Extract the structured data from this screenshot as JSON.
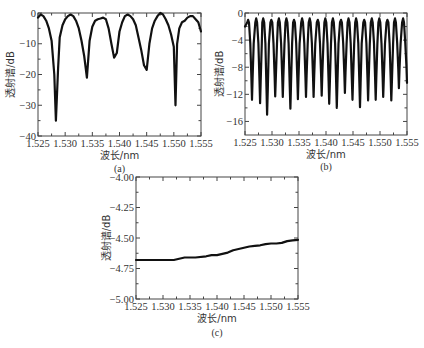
{
  "chart_data": [
    {
      "id": "a",
      "type": "line",
      "panel_label": "(a)",
      "xlabel": "波长/nm",
      "ylabel": "透射谱/dB",
      "xlim": [
        1.525,
        1.555
      ],
      "ylim": [
        -40,
        0
      ],
      "xticks": [
        "1.525",
        "1.530",
        "1.535",
        "1.540",
        "1.545",
        "1.550",
        "1.555"
      ],
      "yticks": [
        "0",
        "−10",
        "−20",
        "−30",
        "−40"
      ],
      "ytick_values": [
        0,
        -10,
        -20,
        -30,
        -40
      ],
      "grid": false,
      "x": [
        1.525,
        1.5255,
        1.526,
        1.5265,
        1.527,
        1.5275,
        1.528,
        1.5283,
        1.5287,
        1.529,
        1.5295,
        1.53,
        1.5305,
        1.531,
        1.5315,
        1.532,
        1.5325,
        1.533,
        1.5335,
        1.534,
        1.5345,
        1.535,
        1.5355,
        1.536,
        1.5365,
        1.537,
        1.5375,
        1.538,
        1.5385,
        1.539,
        1.5395,
        1.54,
        1.5405,
        1.541,
        1.5415,
        1.542,
        1.5425,
        1.543,
        1.5435,
        1.544,
        1.5445,
        1.545,
        1.5455,
        1.546,
        1.5465,
        1.547,
        1.5475,
        1.548,
        1.5485,
        1.549,
        1.5495,
        1.55,
        1.5503,
        1.5506,
        1.551,
        1.5515,
        1.552,
        1.5525,
        1.553,
        1.5535,
        1.554,
        1.5545,
        1.555
      ],
      "values": [
        -1.5,
        -0.5,
        -1,
        -2.5,
        -5,
        -9,
        -20,
        -35,
        -18,
        -8,
        -4,
        -2,
        -1,
        -0.5,
        -1,
        -2.5,
        -5,
        -9,
        -14,
        -21,
        -9,
        -4.5,
        -2.5,
        -2,
        -1.8,
        -1.5,
        -2,
        -5,
        -10,
        -14.5,
        -13,
        -6,
        -3,
        -1,
        -0.5,
        -1,
        -2,
        -4,
        -8,
        -12,
        -17,
        -18.5,
        -10,
        -5,
        -2.5,
        -1,
        0,
        -0.5,
        -2,
        -4,
        -7,
        -11,
        -30,
        -10,
        -5,
        -3,
        -2.5,
        -1.5,
        -1,
        -1,
        -2,
        -3,
        -6
      ]
    },
    {
      "id": "b",
      "type": "line",
      "panel_label": "(b)",
      "xlabel": "波长/nm",
      "ylabel": "透射谱/dB",
      "xlim": [
        1.525,
        1.555
      ],
      "ylim": [
        -18,
        0
      ],
      "xticks": [
        "1.525",
        "1.530",
        "1.535",
        "1.540",
        "1.545",
        "1.550",
        "1.555"
      ],
      "yticks": [
        "0",
        "−4",
        "−8",
        "−12",
        "−16"
      ],
      "ytick_values": [
        0,
        -4,
        -8,
        -12,
        -16
      ],
      "grid": false,
      "period_nm": 0.00145,
      "peak_db": -0.8,
      "dip_x": [
        1.5263,
        1.5278,
        1.5291,
        1.5306,
        1.532,
        1.5334,
        1.5348,
        1.5363,
        1.5377,
        1.5392,
        1.5406,
        1.542,
        1.5435,
        1.5449,
        1.5463,
        1.5478,
        1.5492,
        1.5506,
        1.5521,
        1.5535,
        1.555
      ],
      "dip_values": [
        -12.8,
        -13.3,
        -15.0,
        -12.3,
        -12.4,
        -14.1,
        -12.7,
        -12.4,
        -12.4,
        -12.2,
        -13.4,
        -14.0,
        -11.8,
        -12.8,
        -13.9,
        -12.9,
        -12.8,
        -12.4,
        -12.9,
        -11.1,
        -10.3
      ]
    },
    {
      "id": "c",
      "type": "line",
      "panel_label": "(c)",
      "xlabel": "波长/nm",
      "ylabel": "透射谱/dB",
      "xlim": [
        1.525,
        1.555
      ],
      "ylim": [
        -5.0,
        -4.0
      ],
      "xticks": [
        "1.525",
        "1.530",
        "1.535",
        "1.540",
        "1.545",
        "1.550",
        "1.555"
      ],
      "yticks": [
        "−4.00",
        "−4.25",
        "−4.50",
        "−4.75",
        "−5.00"
      ],
      "ytick_values": [
        -4.0,
        -4.25,
        -4.5,
        -4.75,
        -5.0
      ],
      "grid": false,
      "x": [
        1.525,
        1.527,
        1.529,
        1.531,
        1.532,
        1.533,
        1.534,
        1.536,
        1.538,
        1.539,
        1.54,
        1.541,
        1.542,
        1.543,
        1.544,
        1.545,
        1.546,
        1.547,
        1.548,
        1.549,
        1.55,
        1.551,
        1.552,
        1.553,
        1.554,
        1.555
      ],
      "values": [
        -4.68,
        -4.68,
        -4.68,
        -4.68,
        -4.68,
        -4.67,
        -4.66,
        -4.66,
        -4.65,
        -4.64,
        -4.64,
        -4.63,
        -4.62,
        -4.6,
        -4.59,
        -4.58,
        -4.57,
        -4.565,
        -4.56,
        -4.55,
        -4.545,
        -4.545,
        -4.54,
        -4.525,
        -4.52,
        -4.515
      ]
    }
  ]
}
